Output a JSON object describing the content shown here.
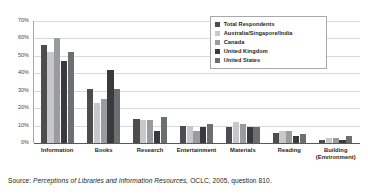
{
  "chart_data": {
    "type": "bar",
    "title": "",
    "xlabel": "",
    "ylabel": "",
    "ylim": [
      0,
      70
    ],
    "ytick_labels": [
      "70%",
      "60%",
      "50%",
      "40%",
      "30%",
      "20%",
      "10%",
      "0%"
    ],
    "ytick_values": [
      70,
      60,
      50,
      40,
      30,
      20,
      10,
      0
    ],
    "grid": true,
    "legend_position": "top-right",
    "categories": [
      "Information",
      "Books",
      "Research",
      "Entertainment",
      "Materials",
      "Reading",
      "Building\n(Environment)"
    ],
    "category_labels": [
      [
        "Information"
      ],
      [
        "Books"
      ],
      [
        "Research"
      ],
      [
        "Entertainment"
      ],
      [
        "Materials"
      ],
      [
        "Reading"
      ],
      [
        "Building",
        "(Environment)"
      ]
    ],
    "series": [
      {
        "name": "Total Respondents",
        "color": "#4d4d4f",
        "values": [
          56,
          31,
          14,
          10,
          9,
          6,
          2
        ]
      },
      {
        "name": "Australia/Singapore/India",
        "color": "#c7c8ca",
        "values": [
          52,
          23,
          13,
          10,
          12,
          7,
          3
        ]
      },
      {
        "name": "Canada",
        "color": "#9a9b9e",
        "values": [
          60,
          25,
          13,
          7,
          11,
          7,
          3
        ]
      },
      {
        "name": "United Kingdom",
        "color": "#3a3a3c",
        "values": [
          47,
          42,
          7,
          9,
          9,
          4,
          2
        ]
      },
      {
        "name": "United States",
        "color": "#6d6e71",
        "values": [
          52,
          31,
          15,
          11,
          9,
          5,
          4
        ]
      }
    ]
  },
  "source": {
    "label": "Source:",
    "title": "Perceptions of Libraries and Information Resources,",
    "rest": "OCLC, 2005, question 810."
  },
  "colors": {
    "gridline": "#d9dadb",
    "axis": "#58595b",
    "text": "#231f20",
    "legend_border": "#a7a9ac",
    "background": "#ffffff"
  }
}
